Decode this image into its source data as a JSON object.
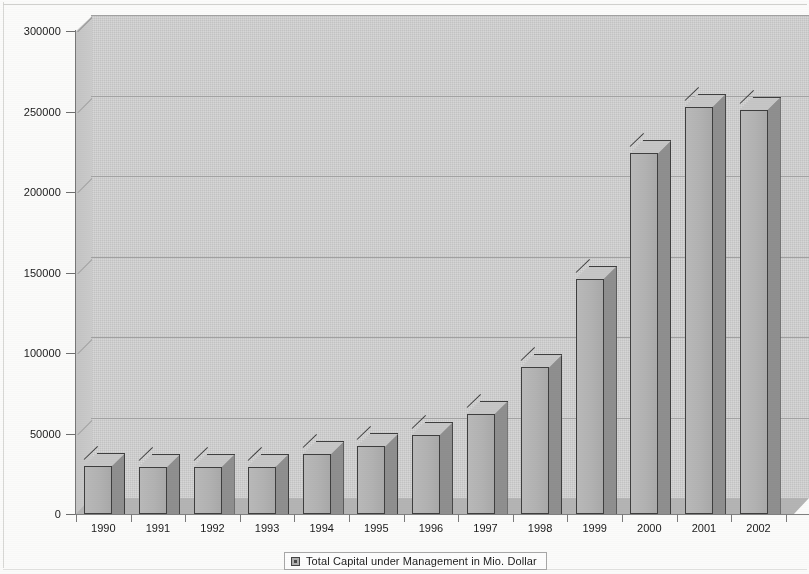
{
  "chart_data": {
    "type": "bar",
    "title": "",
    "subtitle": "",
    "xlabel": "",
    "ylabel": "",
    "categories": [
      "1990",
      "1991",
      "1992",
      "1993",
      "1994",
      "1995",
      "1996",
      "1997",
      "1998",
      "1999",
      "2000",
      "2001",
      "2002"
    ],
    "series": [
      {
        "name": "Total Capital under Management in Mio. Dollar",
        "values": [
          30000,
          29000,
          29000,
          29500,
          37000,
          42000,
          49000,
          62000,
          91000,
          146000,
          224000,
          253000,
          251000
        ]
      }
    ],
    "values": [
      30000,
      29000,
      29000,
      29500,
      37000,
      42000,
      49000,
      62000,
      91000,
      146000,
      224000,
      253000,
      251000
    ],
    "ylim": [
      0,
      300000
    ],
    "yticks": [
      0,
      50000,
      100000,
      150000,
      200000,
      250000,
      300000
    ],
    "ytick_labels": [
      "0",
      "50000",
      "100000",
      "150000",
      "200000",
      "250000",
      "300000"
    ],
    "grid": true,
    "legend_position": "bottom",
    "style": "3d-column",
    "colors": {
      "bar_face": "#b2b2b2",
      "bar_side": "#8e8e8e",
      "bar_top": "#c6c6c6",
      "bar_outline": "#3e3e3e",
      "plot_wall": "#cfcfcf",
      "floor": "#b4b4b4",
      "gridline": "#a2a2a2",
      "axis": "#777777",
      "text": "#1a1a1a"
    }
  },
  "legend": {
    "swatch_icon": "legend-square-icon",
    "label": "Total Capital under Management in Mio. Dollar"
  },
  "axis": {
    "y": {
      "labels": [
        "300000",
        "250000",
        "200000",
        "150000",
        "100000",
        "50000",
        "0"
      ]
    },
    "x": {
      "labels": [
        "1990",
        "1991",
        "1992",
        "1993",
        "1994",
        "1995",
        "1996",
        "1997",
        "1998",
        "1999",
        "2000",
        "2001",
        "2002"
      ]
    }
  }
}
